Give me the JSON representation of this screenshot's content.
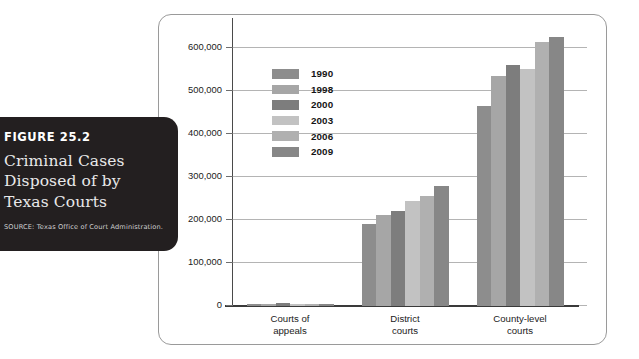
{
  "figure": {
    "number_label": "FIGURE 25.2",
    "title": "Criminal Cases Disposed of by Texas Courts",
    "source": "SOURCE: Texas Office of Court Administration."
  },
  "chart_data": {
    "type": "bar",
    "title": "Criminal Cases Disposed of by Texas Courts",
    "xlabel": "",
    "ylabel": "",
    "ylim": [
      0,
      650000
    ],
    "grid": true,
    "legend_position": "inside-upper-left",
    "categories": [
      "Courts of appeals",
      "District courts",
      "County-level courts"
    ],
    "category_lines": [
      [
        "Courts of",
        "appeals"
      ],
      [
        "District",
        "courts"
      ],
      [
        "County-level",
        "courts"
      ]
    ],
    "ytick_labels": [
      "0",
      "100,000",
      "200,000",
      "300,000",
      "400,000",
      "500,000",
      "600,000"
    ],
    "ytick_values": [
      0,
      100000,
      200000,
      300000,
      400000,
      500000,
      600000
    ],
    "series": [
      {
        "name": "1990",
        "color": "#8d8d8d",
        "values": [
          4500,
          190000,
          465000
        ]
      },
      {
        "name": "1998",
        "color": "#a6a6a6",
        "values": [
          4200,
          212000,
          537000
        ]
      },
      {
        "name": "2000",
        "color": "#7d7d7d",
        "values": [
          6000,
          221000,
          562000
        ]
      },
      {
        "name": "2003",
        "color": "#c2c2c2",
        "values": [
          4300,
          244000,
          553000
        ]
      },
      {
        "name": "2006",
        "color": "#b0b0b0",
        "values": [
          4000,
          257000,
          615000
        ]
      },
      {
        "name": "2009",
        "color": "#878787",
        "values": [
          4100,
          280000,
          627000
        ]
      }
    ]
  }
}
